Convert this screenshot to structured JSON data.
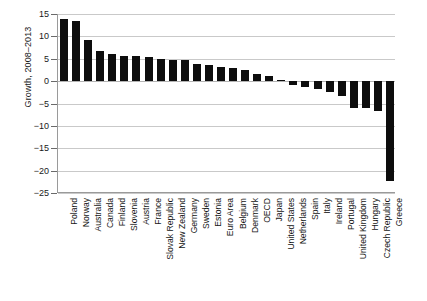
{
  "chart_data": {
    "type": "bar",
    "title": "",
    "subtitle": "",
    "xlabel": "",
    "ylabel": "Growth, 2008–2013",
    "ylim": [
      -25,
      15
    ],
    "yticks": [
      15,
      10,
      5,
      0,
      -5,
      -10,
      -15,
      -20,
      -25
    ],
    "ytick_labels": [
      "15",
      "10",
      "5",
      "0",
      "−5",
      "−10",
      "−15",
      "−20",
      "−25"
    ],
    "grid": true,
    "legend": "none",
    "orientation": "vertical",
    "bar_color": "#0d0d0d",
    "categories": [
      "Poland",
      "Norway",
      "Australia",
      "Canada",
      "Finland",
      "Slovenia",
      "Austria",
      "France",
      "Slovak Republic",
      "New Zealand",
      "Germany",
      "Sweden",
      "Estonia",
      "Euro Area",
      "Belgium",
      "Denmark",
      "OECD",
      "Japan",
      "United States",
      "Netherlands",
      "Spain",
      "Italy",
      "Ireland",
      "Portugal",
      "United Kingdom",
      "Hungary",
      "Czech Republic",
      "Greece"
    ],
    "values": [
      13.8,
      13.5,
      9.2,
      6.8,
      6.1,
      5.6,
      5.6,
      5.4,
      5.0,
      4.7,
      4.7,
      3.9,
      3.6,
      3.2,
      3.0,
      2.4,
      1.6,
      1.2,
      0.2,
      -0.8,
      -1.3,
      -1.8,
      -2.4,
      -3.3,
      -6.0,
      -6.1,
      -6.6,
      -22.4
    ]
  }
}
